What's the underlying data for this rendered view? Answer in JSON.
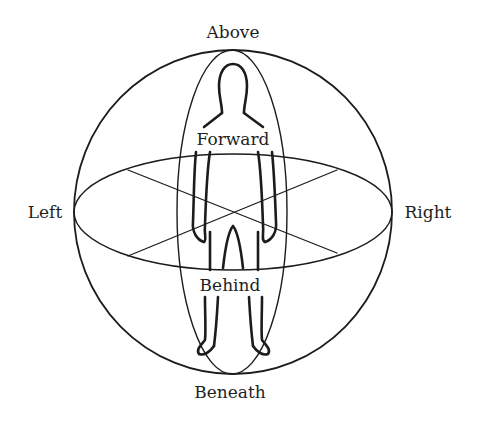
{
  "diagram": {
    "title": "",
    "type": "spatial-orientation-sphere",
    "labels": {
      "above": "Above",
      "beneath": "Beneath",
      "left": "Left",
      "right": "Right",
      "forward": "Forward",
      "behind": "Behind"
    },
    "colors": {
      "stroke": "#1c1c1c",
      "background": "#ffffff",
      "text": "#1f1f1f"
    },
    "shapes": {
      "outer_sphere": {
        "cx": 233,
        "cy": 212,
        "rx": 159,
        "ry": 162
      },
      "vertical_ellipse": {
        "cx": 232,
        "cy": 212,
        "rx": 55,
        "ry": 162
      },
      "horizontal_ellipse": {
        "cx": 233,
        "cy": 212,
        "rx": 159,
        "ry": 58
      },
      "diagonals": [
        {
          "x1": 128,
          "y1": 170,
          "x2": 337,
          "y2": 253
        },
        {
          "x1": 128,
          "y1": 256,
          "x2": 337,
          "y2": 170
        }
      ]
    },
    "figure": "human-silhouette-outline"
  }
}
